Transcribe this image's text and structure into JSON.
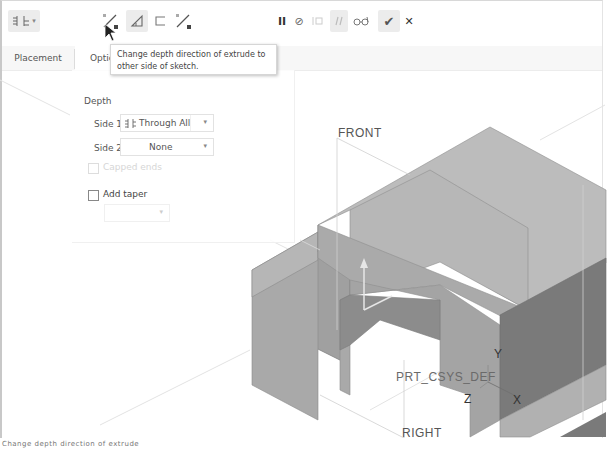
{
  "dashboard": {
    "depth_type_button": {
      "icon": "blind-depth-icon",
      "caret": "▾"
    },
    "flip_direction_button": {
      "icon": "flip-direction-icon"
    },
    "solid_button": {
      "icon": "solid-icon"
    },
    "surface_button": {
      "icon": "surface-icon"
    },
    "flip_material_button": {
      "icon": "flip-material-icon"
    },
    "pause_button": {
      "icon": "pause-icon",
      "glyph": "II"
    },
    "no_preview_button": {
      "icon": "no-preview-icon",
      "glyph": "⊘"
    },
    "attach_preview_button": {
      "icon": "attached-preview-icon"
    },
    "verify_button": {
      "icon": "verify-mode-icon"
    },
    "glasses_button": {
      "icon": "preview-glasses-icon",
      "glyph": "ổd"
    },
    "ok_button": {
      "icon": "check-icon",
      "glyph": "✔"
    },
    "cancel_button": {
      "icon": "close-icon",
      "glyph": "✕"
    }
  },
  "tooltip": {
    "text": "Change depth direction of extrude to other side of sketch."
  },
  "tabs": [
    {
      "label": "Placement",
      "active": false
    },
    {
      "label": "Optic",
      "active": true
    }
  ],
  "options_panel": {
    "depth_heading": "Depth",
    "side1": {
      "label": "Side 1",
      "value": "Through All",
      "icon": "through-all-icon"
    },
    "side2": {
      "label": "Side 2",
      "value": "None"
    },
    "capped_ends": {
      "label": "Capped ends",
      "checked": false,
      "disabled": true
    },
    "add_taper": {
      "label": "Add taper",
      "checked": false
    },
    "taper_dropdown": {
      "value": ""
    }
  },
  "viewport": {
    "datum_labels": {
      "front": "FRONT",
      "right": "RIGHT",
      "csys": "PRT_CSYS_DEF",
      "axis_x": "X",
      "axis_y": "Y",
      "axis_z": "Z"
    },
    "colors": {
      "top_face": "#b9b9b9",
      "left_face": "#a7a7a7",
      "right_face": "#7d7d7d",
      "background": "#ffffff"
    }
  },
  "status_bar": {
    "text": "Change depth direction of extrude"
  }
}
